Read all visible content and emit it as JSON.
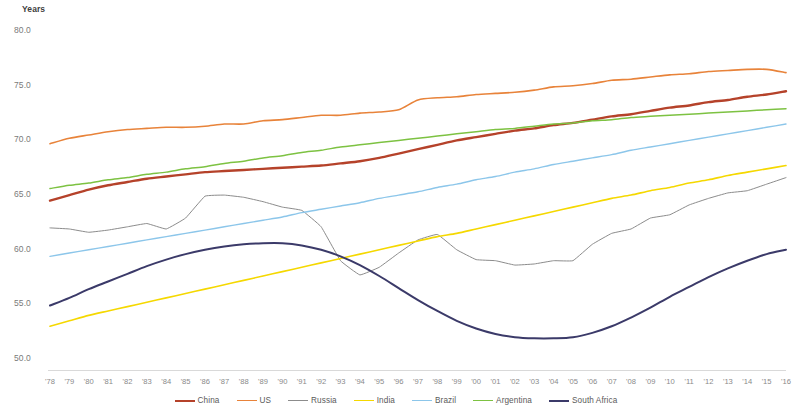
{
  "chart_data": {
    "type": "line",
    "title": "",
    "subtitle": "",
    "xlabel": "",
    "ylabel": "Years",
    "ylim": [
      50.0,
      80.0
    ],
    "grid": false,
    "legend_position": "bottom",
    "y_ticks": [
      "80.0",
      "75.0",
      "70.0",
      "65.0",
      "60.0",
      "55.0",
      "50.0"
    ],
    "y_tick_values": [
      80.0,
      75.0,
      70.0,
      65.0,
      60.0,
      55.0,
      50.0
    ],
    "categories": [
      "'78",
      "'79",
      "'80",
      "'81",
      "'82",
      "'83",
      "'84",
      "'85",
      "'86",
      "'87",
      "'88",
      "'89",
      "'90",
      "'91",
      "'92",
      "'93",
      "'94",
      "'95",
      "'96",
      "'97",
      "'98",
      "'99",
      "'00",
      "'01",
      "'02",
      "'03",
      "'04",
      "'05",
      "'06",
      "'07",
      "'08",
      "'09",
      "'10",
      "'11",
      "'12",
      "'13",
      "'14",
      "'15",
      "'16"
    ],
    "series": [
      {
        "name": "China",
        "color": "#B5422A",
        "values": [
          64.4,
          64.9,
          65.4,
          65.8,
          66.1,
          66.4,
          66.6,
          66.8,
          67.0,
          67.1,
          67.2,
          67.3,
          67.4,
          67.5,
          67.6,
          67.8,
          68.0,
          68.3,
          68.7,
          69.1,
          69.5,
          69.9,
          70.2,
          70.5,
          70.8,
          71.0,
          71.3,
          71.5,
          71.8,
          72.1,
          72.3,
          72.6,
          72.9,
          73.1,
          73.4,
          73.6,
          73.9,
          74.1,
          74.4
        ]
      },
      {
        "name": "US",
        "color": "#E8833A",
        "values": [
          69.6,
          70.1,
          70.4,
          70.7,
          70.9,
          71.0,
          71.1,
          71.1,
          71.2,
          71.4,
          71.4,
          71.7,
          71.8,
          72.0,
          72.2,
          72.2,
          72.4,
          72.5,
          72.7,
          73.6,
          73.8,
          73.9,
          74.1,
          74.2,
          74.3,
          74.5,
          74.8,
          74.9,
          75.1,
          75.4,
          75.5,
          75.7,
          75.9,
          76.0,
          76.2,
          76.3,
          76.4,
          76.4,
          76.1
        ]
      },
      {
        "name": "Russia",
        "color": "#8C8C8C",
        "values": [
          61.9,
          61.8,
          61.5,
          61.7,
          62.0,
          62.3,
          61.8,
          62.8,
          64.8,
          64.9,
          64.7,
          64.3,
          63.8,
          63.5,
          62.0,
          58.9,
          57.6,
          58.3,
          59.6,
          60.8,
          61.3,
          59.9,
          59.0,
          58.9,
          58.5,
          58.6,
          58.9,
          58.9,
          60.4,
          61.4,
          61.8,
          62.8,
          63.1,
          64.0,
          64.6,
          65.1,
          65.3,
          65.9,
          66.5
        ]
      },
      {
        "name": "India",
        "color": "#F5D800",
        "values": [
          52.9,
          53.4,
          53.9,
          54.3,
          54.7,
          55.1,
          55.5,
          55.9,
          56.3,
          56.7,
          57.1,
          57.5,
          57.9,
          58.3,
          58.7,
          59.1,
          59.5,
          59.9,
          60.3,
          60.7,
          61.1,
          61.4,
          61.8,
          62.2,
          62.6,
          63.0,
          63.4,
          63.8,
          64.2,
          64.6,
          64.9,
          65.3,
          65.6,
          66.0,
          66.3,
          66.7,
          67.0,
          67.3,
          67.6
        ]
      },
      {
        "name": "Brazil",
        "color": "#8CC6EA",
        "values": [
          59.3,
          59.6,
          59.9,
          60.2,
          60.5,
          60.8,
          61.1,
          61.4,
          61.7,
          62.0,
          62.3,
          62.6,
          62.9,
          63.3,
          63.6,
          63.9,
          64.2,
          64.6,
          64.9,
          65.2,
          65.6,
          65.9,
          66.3,
          66.6,
          67.0,
          67.3,
          67.7,
          68.0,
          68.3,
          68.6,
          69.0,
          69.3,
          69.6,
          69.9,
          70.2,
          70.5,
          70.8,
          71.1,
          71.4
        ]
      },
      {
        "name": "Argentina",
        "color": "#7DC242",
        "values": [
          65.5,
          65.8,
          66.0,
          66.3,
          66.5,
          66.8,
          67.0,
          67.3,
          67.5,
          67.8,
          68.0,
          68.3,
          68.5,
          68.8,
          69.0,
          69.3,
          69.5,
          69.7,
          69.9,
          70.1,
          70.3,
          70.5,
          70.7,
          70.9,
          71.0,
          71.2,
          71.4,
          71.5,
          71.7,
          71.8,
          72.0,
          72.1,
          72.2,
          72.3,
          72.4,
          72.5,
          72.6,
          72.7,
          72.8
        ]
      },
      {
        "name": "South Africa",
        "color": "#3B3A69",
        "values": [
          54.8,
          55.5,
          56.3,
          57.0,
          57.7,
          58.4,
          59.0,
          59.5,
          59.9,
          60.2,
          60.4,
          60.5,
          60.5,
          60.3,
          59.9,
          59.3,
          58.5,
          57.5,
          56.4,
          55.3,
          54.3,
          53.4,
          52.7,
          52.2,
          51.9,
          51.8,
          51.8,
          51.9,
          52.3,
          52.9,
          53.7,
          54.6,
          55.6,
          56.5,
          57.4,
          58.2,
          58.9,
          59.5,
          59.9
        ]
      }
    ]
  }
}
